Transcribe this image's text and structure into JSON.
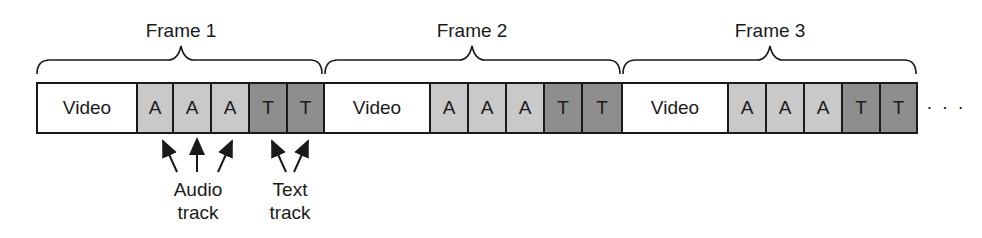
{
  "frames": [
    {
      "label": "Frame 1",
      "cells": [
        "Video",
        "A",
        "A",
        "A",
        "T",
        "T"
      ]
    },
    {
      "label": "Frame 2",
      "cells": [
        "Video",
        "A",
        "A",
        "A",
        "T",
        "T"
      ]
    },
    {
      "label": "Frame 3",
      "cells": [
        "Video",
        "A",
        "A",
        "A",
        "T",
        "T"
      ]
    }
  ],
  "continuation": "· · ·",
  "annotations": {
    "audio": {
      "line1": "Audio",
      "line2": "track"
    },
    "text": {
      "line1": "Text",
      "line2": "track"
    }
  },
  "colors": {
    "video": "#ffffff",
    "audio": "#c9c9c9",
    "text": "#8e8e8e",
    "stroke": "#1a1a1a"
  }
}
